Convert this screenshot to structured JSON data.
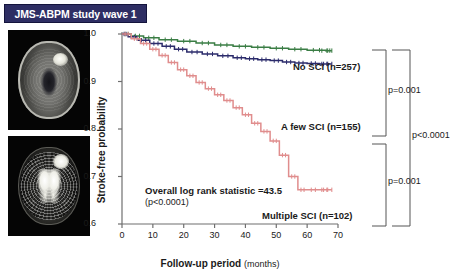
{
  "title": "JMS-ABPM study wave 1",
  "images": [
    {
      "name": "mri-axial-t1",
      "alt": "axial brain MRI with frontal lesion"
    },
    {
      "name": "mri-axial-flair",
      "alt": "axial brain MRI high contrast ventricles"
    }
  ],
  "chart_data": {
    "type": "line",
    "plot_kind": "kaplan-meier",
    "title": "",
    "xlabel": "Follow-up period",
    "xlabel_unit": "(months)",
    "ylabel": "Stroke-free probability",
    "xlim": [
      0,
      70
    ],
    "ylim": [
      0.6,
      1.0
    ],
    "xticks": [
      0,
      10,
      20,
      30,
      40,
      50,
      60,
      70
    ],
    "yticks": [
      "0.6",
      "0.7",
      "0.8",
      "0.9",
      "1.0"
    ],
    "grid": false,
    "legend_position": "inline-right-of-curves",
    "censor_marks": true,
    "series": [
      {
        "name": "No SCI",
        "n": 257,
        "label": "No SCI (n=257)",
        "color": "#3a7d44",
        "x": [
          0,
          3,
          7,
          12,
          18,
          24,
          30,
          36,
          42,
          48,
          54,
          60,
          66,
          68
        ],
        "y": [
          1.0,
          0.996,
          0.992,
          0.988,
          0.985,
          0.981,
          0.977,
          0.974,
          0.972,
          0.97,
          0.968,
          0.966,
          0.965,
          0.965
        ]
      },
      {
        "name": "A few SCI",
        "n": 155,
        "label": "A few SCI (n=155)",
        "color": "#2b2b6b",
        "x": [
          0,
          2,
          5,
          9,
          13,
          17,
          21,
          26,
          31,
          36,
          40,
          44,
          48,
          52,
          56,
          60,
          64,
          68
        ],
        "y": [
          1.0,
          0.994,
          0.987,
          0.98,
          0.974,
          0.968,
          0.962,
          0.958,
          0.954,
          0.95,
          0.948,
          0.946,
          0.944,
          0.941,
          0.939,
          0.938,
          0.937,
          0.937
        ]
      },
      {
        "name": "Multiple SCI",
        "n": 102,
        "label": "Multiple SCI (n=102)",
        "color": "#e08d8d",
        "x": [
          0,
          3,
          6,
          9,
          12,
          15,
          18,
          21,
          24,
          27,
          30,
          33,
          36,
          39,
          42,
          45,
          48,
          51,
          54,
          57,
          60,
          64,
          68
        ],
        "y": [
          1.0,
          0.99,
          0.98,
          0.968,
          0.955,
          0.94,
          0.925,
          0.912,
          0.898,
          0.885,
          0.872,
          0.86,
          0.845,
          0.83,
          0.812,
          0.795,
          0.775,
          0.745,
          0.7,
          0.672,
          0.672,
          0.672,
          0.672
        ]
      }
    ],
    "annotations": {
      "logrank_text": "Overall log rank statistic =43.5",
      "logrank_p": "(p<0.0001)",
      "comparisons": [
        {
          "between": [
            "No SCI",
            "A few SCI"
          ],
          "p": "p=0.001"
        },
        {
          "between": [
            "A few SCI",
            "Multiple SCI"
          ],
          "p": "p=0.001"
        },
        {
          "between": [
            "No SCI",
            "Multiple SCI"
          ],
          "p": "p<0.0001"
        }
      ]
    }
  }
}
